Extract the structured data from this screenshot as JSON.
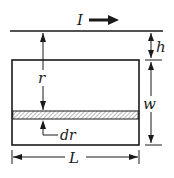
{
  "diagram": {
    "labels": {
      "current": "I",
      "gap": "h",
      "distance": "r",
      "strip_width": "dr",
      "loop_width": "w",
      "loop_length": "L"
    },
    "colors": {
      "stroke": "#1a1a1a",
      "hatch": "#8a8a8a",
      "background": "#ffffff"
    }
  }
}
